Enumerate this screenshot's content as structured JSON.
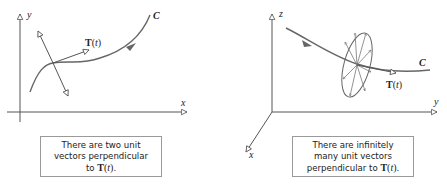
{
  "figure": {
    "left_panel": {
      "axes": {
        "vertical": "y",
        "horizontal": "x"
      },
      "curve_label": "C",
      "tangent_label": {
        "bold": "T",
        "arg": "t"
      },
      "caption": {
        "line1": "There are two unit",
        "line2": "vectors perpendicular",
        "line3_prefix": "to ",
        "line3_suffix": "."
      }
    },
    "right_panel": {
      "axes": {
        "vertical": "z",
        "horizontal": "y",
        "diagonal": "x"
      },
      "curve_label": "C",
      "tangent_label": {
        "bold": "T",
        "arg": "t"
      },
      "caption": {
        "line1": "There are infinitely",
        "line2": "many unit vectors",
        "line3_prefix": "perpendicular to ",
        "line3_suffix": "."
      }
    },
    "colors": {
      "axis": "#555555",
      "curve": "#666666",
      "vector": "#555555",
      "caption_border": "#9a9a9a",
      "text": "#222222"
    }
  }
}
